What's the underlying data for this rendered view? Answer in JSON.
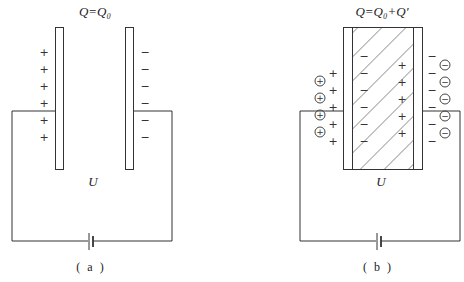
{
  "panels": [
    {
      "id": "a",
      "title": "Q=Q₀",
      "voltage_label": "U",
      "caption": "( a )",
      "plate_charges": {
        "left": "+",
        "right": "−"
      },
      "description": "Parallel-plate capacitor with vacuum/air gap connected to battery"
    },
    {
      "id": "b",
      "title": "Q=Q₀+Q′",
      "voltage_label": "U",
      "caption": "( b )",
      "plate_charges": {
        "left": "+",
        "right": "−"
      },
      "extra_charges": {
        "left": "⊕",
        "right": "⊖"
      },
      "dielectric_bound_charges": {
        "left": "−",
        "right": "+"
      },
      "description": "Same capacitor with hatched dielectric slab inserted; additional charge Q′ flows onto plates"
    }
  ],
  "colors": {
    "line": "#333333",
    "background": "#ffffff"
  }
}
